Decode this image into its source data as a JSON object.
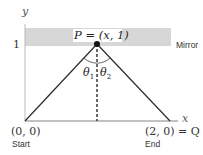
{
  "diagram": {
    "axes": {
      "x_label": "x",
      "y_label": "y",
      "y_tick": "1"
    },
    "mirror": {
      "label": "Mirror"
    },
    "points": {
      "P": {
        "label": "P = (x, 1)"
      },
      "start": {
        "coords": "(0, 0)",
        "label": "Start"
      },
      "end": {
        "coords": "(2, 0) = Q",
        "label": "End"
      }
    },
    "angles": {
      "theta1": "θ1",
      "theta2": "θ2"
    },
    "colors": {
      "line": "#2b2b2b",
      "hatch": "#9a9a9a",
      "text": "#333333"
    }
  }
}
